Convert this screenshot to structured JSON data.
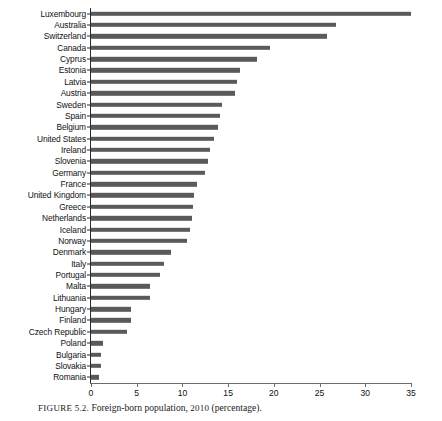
{
  "caption": {
    "prefix": "FIGURE",
    "number": "5.2.",
    "text": "Foreign-born population,",
    "year": "2010",
    "suffix": "(percentage)."
  },
  "axis": {
    "x_ticks": [
      "0",
      "5",
      "10",
      "15",
      "20",
      "25",
      "30",
      "35"
    ],
    "x_min": 0,
    "x_max": 35,
    "bar_color": "#5a5a5a",
    "axis_color": "#2b2b2b"
  },
  "chart_data": {
    "type": "bar",
    "orientation": "horizontal",
    "title": "FIGURE 5.2. Foreign-born population, 2010 (percentage).",
    "xlabel": "",
    "ylabel": "",
    "xlim": [
      0,
      35
    ],
    "grid": false,
    "legend": null,
    "categories": [
      "Luxembourg",
      "Australia",
      "Switzerland",
      "Canada",
      "Cyprus",
      "Estonia",
      "Latvia",
      "Austria",
      "Sweden",
      "Spain",
      "Belgium",
      "United States",
      "Ireland",
      "Slovenia",
      "Germany",
      "France",
      "United Kingdom",
      "Greece",
      "Netherlands",
      "Iceland",
      "Norway",
      "Denmark",
      "Italy",
      "Portugal",
      "Malta",
      "Lithuania",
      "Hungary",
      "Finland",
      "Czech Republic",
      "Poland",
      "Bulgaria",
      "Slovakia",
      "Romania"
    ],
    "values": [
      35.0,
      26.8,
      25.8,
      19.6,
      18.2,
      16.3,
      16.0,
      15.7,
      14.3,
      14.1,
      13.9,
      13.5,
      13.0,
      12.8,
      12.5,
      11.6,
      11.3,
      11.2,
      11.1,
      10.8,
      10.5,
      8.8,
      8.0,
      7.5,
      6.5,
      6.4,
      4.4,
      4.4,
      3.9,
      1.3,
      1.1,
      1.1,
      0.9
    ]
  }
}
